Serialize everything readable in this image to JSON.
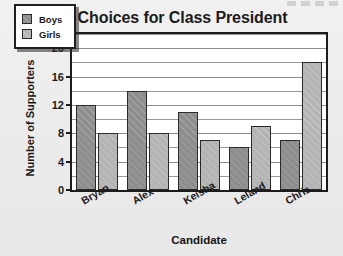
{
  "chart_data": {
    "type": "bar",
    "title": "Choices for Class President",
    "xlabel": "Candidate",
    "ylabel": "Number of Supporters",
    "categories": [
      "Bryan",
      "Alex",
      "Keisha",
      "Leland",
      "Chris"
    ],
    "series": [
      {
        "name": "Boys",
        "values": [
          12,
          14,
          11,
          6,
          7
        ],
        "color": "#8e8e8e"
      },
      {
        "name": "Girls",
        "values": [
          8,
          8,
          7,
          9,
          18
        ],
        "color": "#b4b4b4"
      }
    ],
    "ylim": [
      0,
      22
    ],
    "ytick_labels": [
      "0",
      "4",
      "8",
      "12",
      "16",
      "20"
    ],
    "ytick_values": [
      0,
      4,
      8,
      12,
      16,
      20
    ],
    "minor_gridline_step": 2,
    "grid": true,
    "legend_position": "top-left-inside"
  },
  "legend": {
    "entries": [
      {
        "label": "Boys"
      },
      {
        "label": "Girls"
      }
    ]
  },
  "axes": {
    "y_title": "Number of Supporters",
    "x_title": "Candidate"
  }
}
